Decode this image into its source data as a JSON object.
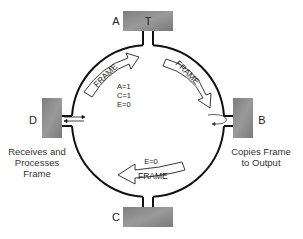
{
  "diagram": {
    "type": "token-ring-frame-flow",
    "colors": {
      "station_fill": "#8a8a8a",
      "ring_stroke": "#111111",
      "arrow_fill": "#ffffff",
      "text": "#222222"
    },
    "stations": [
      {
        "id": "A",
        "label": "A",
        "inner_label": "T",
        "position": "top"
      },
      {
        "id": "B",
        "label": "B",
        "position": "right",
        "caption": [
          "Copies Frame",
          "to Output"
        ]
      },
      {
        "id": "C",
        "label": "C",
        "position": "bottom"
      },
      {
        "id": "D",
        "label": "D",
        "position": "left",
        "caption": [
          "Receives and",
          "Processes",
          "Frame"
        ]
      }
    ],
    "arrows": [
      {
        "id": "frame-d-to-a",
        "label": "FRAME",
        "from": "D",
        "to": "A"
      },
      {
        "id": "frame-a-to-b",
        "label": "FRAME",
        "from": "A",
        "to": "B"
      },
      {
        "id": "frame-c-to-d",
        "label": "FRAME",
        "from": "B",
        "to": "D"
      }
    ],
    "status_bits_upper": [
      "A=1",
      "C=1",
      "E=0"
    ],
    "status_bits_lower": [
      "E=0"
    ]
  }
}
